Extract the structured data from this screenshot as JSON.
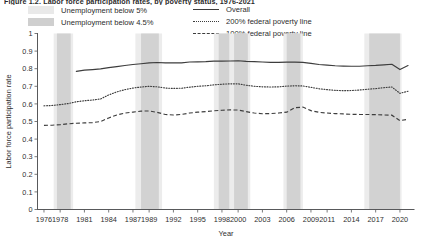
{
  "figure": {
    "title": "Figure 1.2. Labor force participation rates, by poverty status, 1976-2021"
  },
  "legend": {
    "left_items": [
      {
        "label": "Unemployment below 5%",
        "type": "band",
        "color": "#e9e9e9",
        "name": "legend-band-below-5"
      },
      {
        "label": "Unemployment below 4.5%",
        "type": "band",
        "color": "#cfcfcf",
        "name": "legend-band-below-4-5"
      }
    ],
    "right_items": [
      {
        "label": "Overall",
        "type": "line",
        "style": "solid",
        "color": "#3d3d3d",
        "name": "legend-line-overall"
      },
      {
        "label": "200% federal poverty line",
        "type": "line",
        "style": "dotted",
        "color": "#3d3d3d",
        "name": "legend-line-200-fpl"
      },
      {
        "label": "100% federal poverty line",
        "type": "line",
        "style": "dashed",
        "color": "#3d3d3d",
        "name": "legend-line-100-fpl"
      }
    ]
  },
  "chart_data": {
    "type": "line",
    "xlabel": "Year",
    "ylabel": "Labor force participation rate",
    "xlim": [
      1975.2,
      2021.8
    ],
    "ylim": [
      0,
      1
    ],
    "grid": false,
    "legend_position": "top",
    "y_ticks": [
      0,
      0.1,
      0.2,
      0.3,
      0.4,
      0.5,
      0.6,
      0.7,
      0.8,
      0.9,
      1
    ],
    "y_tick_labels": [
      "0",
      "0.1",
      "0.2",
      "0.3",
      "0.4",
      "0.5",
      "0.6",
      "0.7",
      "0.8",
      "0.9",
      "1"
    ],
    "x_ticks": [
      1976,
      1978,
      1981,
      1984,
      1987,
      1989,
      1992,
      1995,
      1998,
      2000,
      2003,
      2006,
      2009,
      2011,
      2014,
      2017,
      2020
    ],
    "x_tick_labels": [
      "1976",
      "1978",
      "1981",
      "1984",
      "1987",
      "1989",
      "1992",
      "1995",
      "1998",
      "2000",
      "2003",
      "2006",
      "2009",
      "2011",
      "2014",
      "2017",
      "2020"
    ],
    "shaded_bands": [
      {
        "label": "Unemployment below 5%",
        "color": "#ececec",
        "start": 1977.2,
        "end": 1979.6
      },
      {
        "label": "Unemployment below 4.5%",
        "color": "#d2d2d2",
        "start": 1977.6,
        "end": 1979.3
      },
      {
        "label": "Unemployment below 5%",
        "color": "#ececec",
        "start": 1987.3,
        "end": 1990.6
      },
      {
        "label": "Unemployment below 4.5%",
        "color": "#d2d2d2",
        "start": 1988.0,
        "end": 1990.2
      },
      {
        "label": "Unemployment below 5%",
        "color": "#ececec",
        "start": 1997.0,
        "end": 2001.5
      },
      {
        "label": "Unemployment below 4.5%",
        "color": "#d2d2d2",
        "start": 1997.6,
        "end": 1998.9
      },
      {
        "label": "Unemployment below 4.5%",
        "color": "#d2d2d2",
        "start": 1999.5,
        "end": 2001.2
      },
      {
        "label": "Unemployment below 5%",
        "color": "#ececec",
        "start": 2005.6,
        "end": 2008.0
      },
      {
        "label": "Unemployment below 4.5%",
        "color": "#d2d2d2",
        "start": 2006.0,
        "end": 2007.7
      },
      {
        "label": "Unemployment below 5%",
        "color": "#ececec",
        "start": 2015.6,
        "end": 2020.2
      },
      {
        "label": "Unemployment below 4.5%",
        "color": "#d2d2d2",
        "start": 2016.2,
        "end": 2020.0
      }
    ],
    "x": [
      1976,
      1977,
      1978,
      1979,
      1980,
      1981,
      1982,
      1983,
      1984,
      1985,
      1986,
      1987,
      1988,
      1989,
      1990,
      1991,
      1992,
      1993,
      1994,
      1995,
      1996,
      1997,
      1998,
      1999,
      2000,
      2001,
      2002,
      2003,
      2004,
      2005,
      2006,
      2007,
      2008,
      2009,
      2010,
      2011,
      2012,
      2013,
      2014,
      2015,
      2016,
      2017,
      2018,
      2019,
      2020,
      2021
    ],
    "series": [
      {
        "name": "Overall",
        "style": "solid",
        "color": "#3d3d3d",
        "start_year": 1980,
        "values": [
          null,
          null,
          null,
          null,
          0.785,
          0.792,
          0.795,
          0.799,
          0.806,
          0.812,
          0.818,
          0.824,
          0.828,
          0.833,
          0.835,
          0.833,
          0.833,
          0.833,
          0.838,
          0.839,
          0.84,
          0.843,
          0.843,
          0.844,
          0.845,
          0.842,
          0.84,
          0.838,
          0.836,
          0.836,
          0.837,
          0.837,
          0.836,
          0.83,
          0.824,
          0.82,
          0.817,
          0.815,
          0.814,
          0.814,
          0.817,
          0.819,
          0.822,
          0.825,
          0.795,
          0.818
        ]
      },
      {
        "name": "200% federal poverty line",
        "style": "dotted",
        "color": "#3d3d3d",
        "values": [
          0.589,
          0.591,
          0.596,
          0.602,
          0.612,
          0.618,
          0.622,
          0.628,
          0.651,
          0.668,
          0.681,
          0.69,
          0.696,
          0.7,
          0.697,
          0.69,
          0.688,
          0.689,
          0.695,
          0.7,
          0.703,
          0.708,
          0.712,
          0.714,
          0.714,
          0.706,
          0.7,
          0.697,
          0.696,
          0.697,
          0.701,
          0.703,
          0.702,
          0.694,
          0.686,
          0.681,
          0.677,
          0.675,
          0.676,
          0.679,
          0.683,
          0.687,
          0.692,
          0.696,
          0.66,
          0.672
        ]
      },
      {
        "name": "100% federal poverty line",
        "style": "dashed",
        "color": "#3d3d3d",
        "values": [
          0.478,
          0.479,
          0.482,
          0.487,
          0.49,
          0.492,
          0.494,
          0.5,
          0.52,
          0.537,
          0.548,
          0.553,
          0.559,
          0.56,
          0.552,
          0.54,
          0.537,
          0.54,
          0.548,
          0.553,
          0.556,
          0.561,
          0.564,
          0.566,
          0.565,
          0.556,
          0.548,
          0.544,
          0.545,
          0.548,
          0.553,
          0.578,
          0.582,
          0.562,
          0.552,
          0.548,
          0.545,
          0.543,
          0.541,
          0.54,
          0.54,
          0.539,
          0.537,
          0.536,
          0.505,
          0.512
        ]
      }
    ]
  }
}
